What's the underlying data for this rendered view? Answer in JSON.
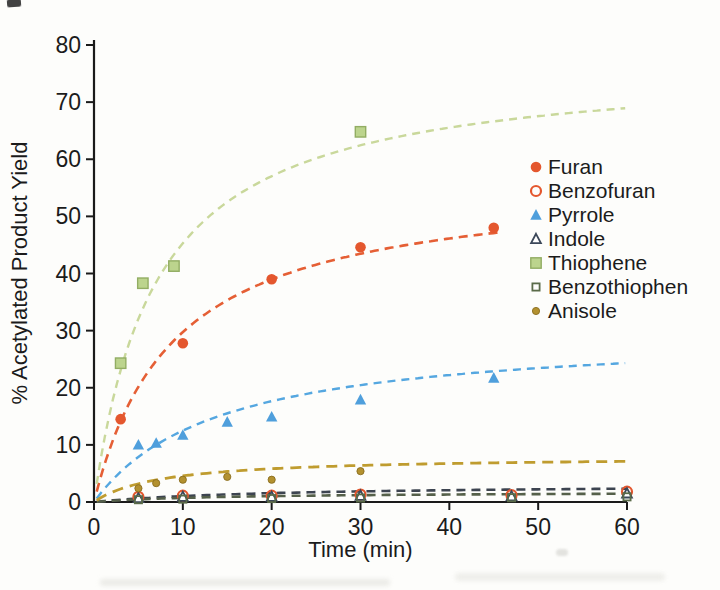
{
  "figure": {
    "background": "#fdfdfb",
    "axis_color": "#1a1a1a",
    "text_color": "#1b1b1b"
  },
  "chart_data": {
    "type": "scatter",
    "title": "",
    "xlabel": "Time (min)",
    "ylabel": "% Acetylated Product Yield",
    "xlim": [
      0,
      60
    ],
    "ylim": [
      0,
      80
    ],
    "x_ticks": [
      0,
      10,
      20,
      30,
      40,
      50,
      60
    ],
    "y_ticks": [
      0,
      10,
      20,
      30,
      40,
      50,
      60,
      70,
      80
    ],
    "grid": false,
    "legend_position": "right-inside",
    "curve_model": "y = a*t/(b+t), dashed least-squares fit",
    "series": [
      {
        "name": "Furan",
        "marker": "circle-filled",
        "color": "#e4572e",
        "line": {
          "color": "#e55f35",
          "dash": [
            9,
            6
          ],
          "width": 2.6
        },
        "fit": {
          "a": 56.5,
          "b": 9,
          "t_end": 46
        },
        "points": [
          [
            3,
            14.5
          ],
          [
            10,
            27.8
          ],
          [
            20,
            39.0
          ],
          [
            30,
            44.6
          ],
          [
            45,
            48.0
          ]
        ]
      },
      {
        "name": "Benzofuran",
        "marker": "circle-open",
        "color": "#e4572e",
        "line": null,
        "fit": null,
        "points": [
          [
            5,
            0.9
          ],
          [
            10,
            1.1
          ],
          [
            20,
            1.1
          ],
          [
            30,
            1.3
          ],
          [
            47,
            1.2
          ],
          [
            60,
            1.8
          ]
        ]
      },
      {
        "name": "Pyrrole",
        "marker": "triangle-filled",
        "color": "#4f9fdc",
        "line": {
          "color": "#55a7e0",
          "dash": [
            8,
            6
          ],
          "width": 2.4
        },
        "fit": {
          "a": 30,
          "b": 14,
          "t_end": 59.8
        },
        "points": [
          [
            5,
            10.0
          ],
          [
            7,
            10.3
          ],
          [
            10,
            11.7
          ],
          [
            15,
            14.0
          ],
          [
            20,
            14.9
          ],
          [
            30,
            17.9
          ],
          [
            45,
            21.7
          ]
        ]
      },
      {
        "name": "Indole",
        "marker": "triangle-open",
        "color": "#3c4859",
        "line": {
          "color": "#3d4450",
          "dash": [
            9,
            6
          ],
          "width": 2.6
        },
        "fit": {
          "a": 3.1,
          "b": 20,
          "t_end": 60
        },
        "points": [
          [
            5,
            0.7
          ],
          [
            10,
            0.9
          ],
          [
            20,
            0.9
          ],
          [
            30,
            1.1
          ],
          [
            47,
            1.0
          ],
          [
            60,
            1.5
          ]
        ]
      },
      {
        "name": "Thiophene",
        "marker": "square-filled",
        "color": "#bcd48d",
        "border": "#92ad63",
        "line": {
          "color": "#c9d89b",
          "dash": [
            8,
            6
          ],
          "width": 2.4
        },
        "fit": {
          "a": 77,
          "b": 7,
          "t_end": 59.8
        },
        "points": [
          [
            3,
            24.3
          ],
          [
            5.5,
            38.3
          ],
          [
            9,
            41.3
          ],
          [
            30,
            64.8
          ]
        ]
      },
      {
        "name": "Benzothiophen",
        "marker": "square-open",
        "color": "#5a6b49",
        "line": {
          "color": "#55604a",
          "dash": [
            9,
            6
          ],
          "width": 2.6
        },
        "fit": {
          "a": 1.8,
          "b": 15,
          "t_end": 60
        },
        "points": [
          [
            5,
            0.4
          ],
          [
            10,
            0.5
          ],
          [
            20,
            0.6
          ],
          [
            30,
            0.7
          ],
          [
            47,
            0.75
          ],
          [
            60,
            0.9
          ]
        ]
      },
      {
        "name": "Anisole",
        "marker": "dot-filled",
        "color": "#b3912f",
        "border": "#8a6d1f",
        "line": {
          "color": "#bf9c2f",
          "dash": [
            11,
            7
          ],
          "width": 2.8
        },
        "fit": {
          "a": 8,
          "b": 7.5,
          "t_end": 60
        },
        "points": [
          [
            5,
            2.4
          ],
          [
            7,
            3.3
          ],
          [
            10,
            3.9
          ],
          [
            15,
            4.4
          ],
          [
            20,
            3.9
          ],
          [
            30,
            5.4
          ]
        ]
      }
    ]
  }
}
